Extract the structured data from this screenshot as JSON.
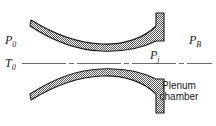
{
  "figure": {
    "name": "plenum-chamber-nozzle-cross-section",
    "background_color": "#ffffff",
    "line_color": "#1a1a1a",
    "hatch_color": "#808080",
    "centerline_color": "#666666"
  },
  "labels": {
    "p0": "P",
    "p0_sub": "0",
    "t0": "T",
    "t0_sub": "0",
    "pj": "P",
    "pj_sub": "j",
    "pb": "P",
    "pb_sub": "B",
    "plenum": "Plenum\nchamber"
  },
  "geometry": {
    "upper_wall_note": "curved hatched band, concave up, throat near x=100",
    "lower_wall_note": "curved hatched band, convex up, mirror of upper",
    "exit_lip_x": 158,
    "centerline_y": 63
  }
}
